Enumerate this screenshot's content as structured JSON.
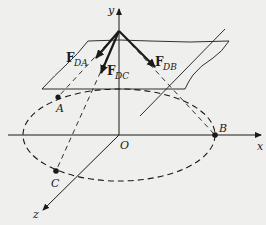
{
  "figure": {
    "axes": {
      "x_label": "x",
      "y_label": "y",
      "z_label": "z",
      "origin_label": "O"
    },
    "points": {
      "A": "A",
      "B": "B",
      "C": "C"
    },
    "forces": [
      {
        "symbol": "F",
        "subscript": "DA"
      },
      {
        "symbol": "F",
        "subscript": "DC"
      },
      {
        "symbol": "F",
        "subscript": "DB"
      }
    ],
    "colors": {
      "background": "#efefed",
      "ink": "#1a1a1a"
    }
  }
}
